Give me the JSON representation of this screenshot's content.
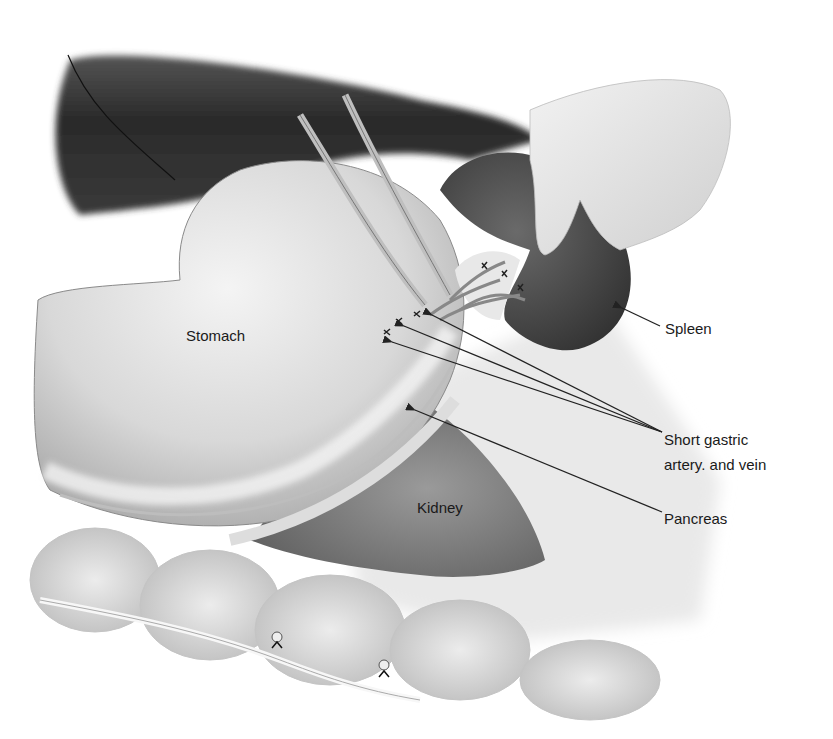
{
  "figure": {
    "type": "anatomical illustration",
    "labels": {
      "stomach": "Stomach",
      "kidney": "Kidney",
      "spleen": "Spleen",
      "short_gastric_line1": "Short gastric",
      "short_gastric_line2": "artery. and vein",
      "pancreas": "Pancreas"
    },
    "colors": {
      "background": "#ffffff",
      "liver": "#2e2e2e",
      "spleen": "#4a4a4a",
      "stomach": "#d9d9d9",
      "kidney": "#8a8a8a",
      "colon": "#cfcfcf",
      "label_text": "#1a1a1a",
      "leader_line": "#222222"
    }
  }
}
